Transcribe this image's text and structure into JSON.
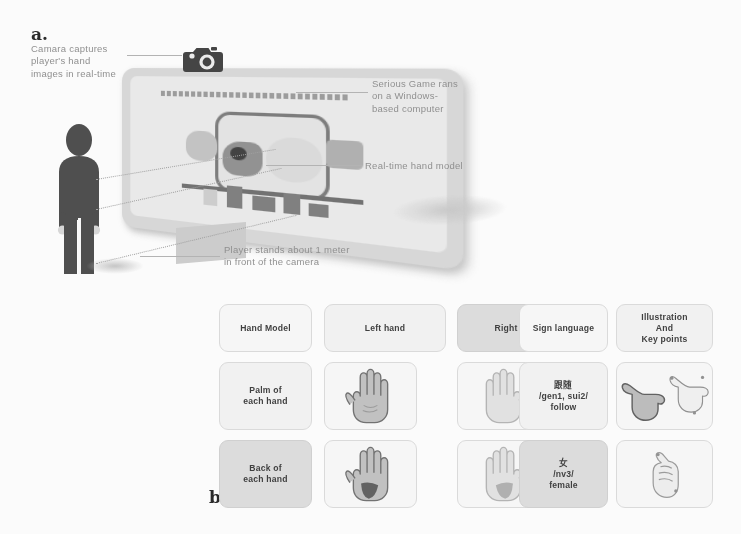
{
  "figure": {
    "panels": [
      {
        "letter": "a."
      },
      {
        "letter": "b."
      },
      {
        "letter": "c."
      }
    ]
  },
  "panel_a": {
    "letter": "a.",
    "annotations": {
      "camera": "Camara captures\nplayer's hand\nimages in real-time",
      "game": "Serious Game rans\non a Windows-\nbased computer",
      "hand_model": "Real-time hand model",
      "player": "Player stands about 1 meter\nin front of the camera"
    },
    "icons": {
      "camera": "camera-icon",
      "person": "person-silhouette-icon",
      "monitor": "tv-monitor-icon"
    }
  },
  "panel_b": {
    "letter": "b.",
    "headers": [
      "Hand Model",
      "Left hand",
      "Right hand"
    ],
    "rows": [
      {
        "label": "Palm of\neach hand",
        "left": "left-palm-hand-icon",
        "right": "right-palm-hand-icon"
      },
      {
        "label": "Back of\neach hand",
        "left": "left-back-hand-icon",
        "right": "right-back-hand-icon"
      }
    ]
  },
  "panel_c": {
    "letter": "c.",
    "headers": [
      "Sign language",
      "Illustration\nAnd\nKey points"
    ],
    "rows": [
      {
        "sign": "跟随\n/gen1, sui2/\nfollow",
        "illustration": "follow-sign-hand-icon"
      },
      {
        "sign": "女\n/nv3/\nfemale",
        "illustration": "female-sign-hand-icon"
      }
    ]
  },
  "colors": {
    "page_background": "#ffffff",
    "annotation_text": "#8e8e8e",
    "cell_text": "#3a3a3a",
    "cell_light": "#f4f4f4",
    "cell_mid": "#ebebeb",
    "cell_dark": "#dedede",
    "hand_fill": "#c9c9c9",
    "hand_outline": "#6f6f6f",
    "hand_accent": "#5e5e5e",
    "silhouette": "#4a4a4a"
  }
}
